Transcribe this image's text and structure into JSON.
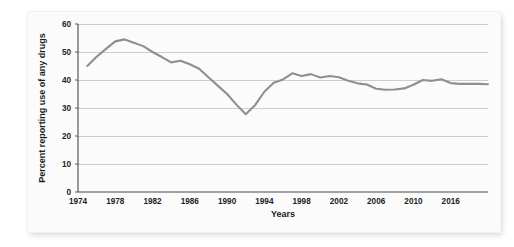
{
  "chart_data": {
    "type": "line",
    "title": "",
    "xlabel": "Years",
    "ylabel": "Percent reporting use of any drugs",
    "xlim": [
      1974,
      2018
    ],
    "ylim": [
      0,
      60
    ],
    "grid": true,
    "legend": "none",
    "line_color": "#8f8f8f",
    "xtick_labels": [
      "1974",
      "1978",
      "1982",
      "1986",
      "1990",
      "1994",
      "1998",
      "2002",
      "2006",
      "2010",
      "2016"
    ],
    "xtick_values": [
      1974,
      1978,
      1982,
      1986,
      1990,
      1994,
      1998,
      2002,
      2006,
      2010,
      2014
    ],
    "ytick_labels": [
      "0",
      "10",
      "20",
      "30",
      "40",
      "50",
      "60"
    ],
    "ytick_values": [
      0,
      10,
      20,
      30,
      40,
      50,
      60
    ],
    "x": [
      1975,
      1976,
      1977,
      1978,
      1979,
      1980,
      1981,
      1982,
      1983,
      1984,
      1985,
      1986,
      1987,
      1988,
      1989,
      1990,
      1991,
      1992,
      1993,
      1994,
      1995,
      1996,
      1997,
      1998,
      1999,
      2000,
      2001,
      2002,
      2003,
      2004,
      2005,
      2006,
      2007,
      2008,
      2009,
      2010,
      2011,
      2012,
      2013,
      2014,
      2015,
      2016,
      2017,
      2018
    ],
    "values": [
      45.0,
      48.3,
      51.1,
      53.8,
      54.5,
      53.3,
      52.1,
      50.0,
      48.2,
      46.3,
      46.9,
      45.6,
      44.0,
      41.0,
      38.0,
      35.0,
      31.2,
      27.8,
      31.0,
      35.8,
      39.0,
      40.2,
      42.4,
      41.4,
      42.1,
      40.9,
      41.4,
      41.0,
      39.7,
      38.8,
      38.4,
      36.9,
      36.5,
      36.6,
      37.0,
      38.3,
      40.0,
      39.7,
      40.3,
      38.9,
      38.6,
      38.6,
      38.6,
      38.5
    ],
    "peak": {
      "year": 1979,
      "value": 54.5
    },
    "trough": {
      "year": 1992,
      "value": 27.8
    }
  },
  "figure": {
    "background": "#fbfbfb",
    "page_background": "#ffffff"
  }
}
